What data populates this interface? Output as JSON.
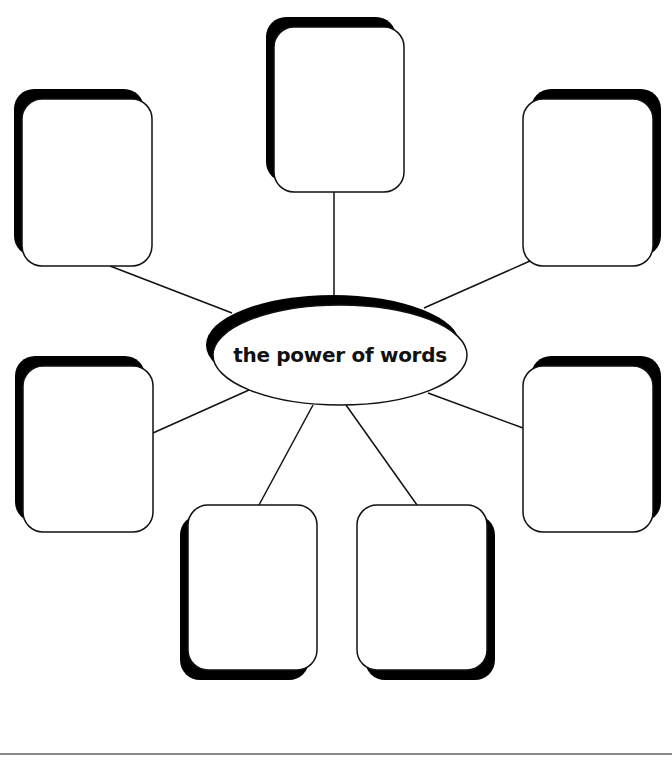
{
  "diagram": {
    "type": "concept-web",
    "center": {
      "label": "the power of words",
      "cx": 340,
      "cy": 355,
      "rx": 127,
      "ry": 50
    },
    "boxes": [
      {
        "id": "top",
        "x": 274,
        "y": 27,
        "w": 130,
        "h": 165,
        "shadow": "top-left",
        "text": ""
      },
      {
        "id": "top-left",
        "x": 22,
        "y": 99,
        "w": 130,
        "h": 167,
        "shadow": "top-left",
        "text": ""
      },
      {
        "id": "top-right",
        "x": 523,
        "y": 99,
        "w": 130,
        "h": 167,
        "shadow": "top-right",
        "text": ""
      },
      {
        "id": "middle-left",
        "x": 23,
        "y": 366,
        "w": 130,
        "h": 166,
        "shadow": "top-left",
        "text": ""
      },
      {
        "id": "middle-right",
        "x": 523,
        "y": 366,
        "w": 130,
        "h": 166,
        "shadow": "top-right",
        "text": ""
      },
      {
        "id": "bottom-left",
        "x": 188,
        "y": 505,
        "w": 129,
        "h": 165,
        "shadow": "bottom-left",
        "text": ""
      },
      {
        "id": "bottom-right",
        "x": 357,
        "y": 505,
        "w": 130,
        "h": 165,
        "shadow": "bottom-right",
        "text": ""
      }
    ],
    "colors": {
      "stroke": "#111111",
      "shadow": "#000000",
      "fill": "#ffffff",
      "rule": "#8a8a8a"
    }
  }
}
